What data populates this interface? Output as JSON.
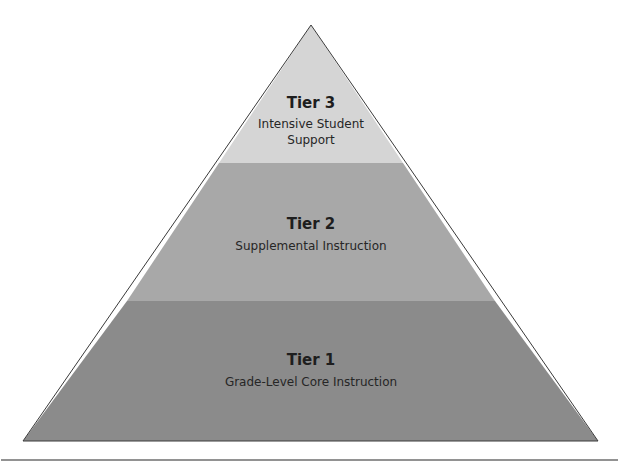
{
  "diagram": {
    "type": "pyramid",
    "colors": {
      "tier3": "#d5d5d5",
      "tier2": "#a8a8a8",
      "tier1": "#8b8b8b",
      "outline": "#3a3a3a",
      "rule": "#6e6e6e"
    },
    "tiers": [
      {
        "title": "Tier 3",
        "lines": [
          "Intensive Student",
          "Support"
        ]
      },
      {
        "title": "Tier 2",
        "lines": [
          "Supplemental Instruction"
        ]
      },
      {
        "title": "Tier 1",
        "lines": [
          "Grade-Level Core Instruction"
        ]
      }
    ]
  }
}
